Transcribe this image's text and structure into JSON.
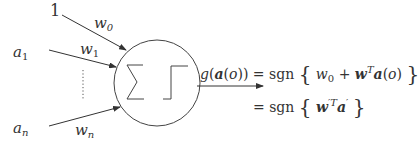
{
  "diagram": {
    "type": "perceptron",
    "inputs": [
      {
        "label": "1",
        "weight": "w",
        "weight_sub": "0"
      },
      {
        "label": "a",
        "label_sub": "1",
        "weight": "w",
        "weight_sub": "1"
      },
      {
        "label": "a",
        "label_sub": "n",
        "weight": "w",
        "weight_sub": "n"
      }
    ],
    "ellipsis": "vertical dots",
    "node_symbols": [
      "sum-symbol",
      "step-function-symbol"
    ],
    "output": {
      "lhs": "g(a(o))",
      "line1": "= sgn { w0 + w^T a(o) }",
      "line2": "= sgn { w'^T a' }"
    }
  },
  "text": {
    "one": "1",
    "a": "a",
    "sub1": "1",
    "subn": "n",
    "w": "w",
    "sub0": "0",
    "g": "g",
    "sgn": "sgn",
    "eq": "=",
    "plus": "+",
    "T": "T",
    "primeT": "′T",
    "prime": "′",
    "lbrace": "{",
    "rbrace": "}",
    "lpar": "(",
    "rpar": ")",
    "o": "o",
    "bold_a": "a",
    "bold_w": "w",
    "sigma": "∑"
  }
}
